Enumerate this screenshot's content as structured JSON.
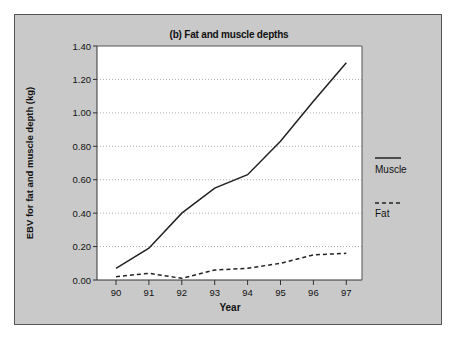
{
  "chart_data": {
    "type": "line",
    "title": "(b) Fat and muscle depths",
    "xlabel": "Year",
    "ylabel": "EBV for fat and muscle depth (kg)",
    "x": [
      "90",
      "91",
      "92",
      "93",
      "94",
      "95",
      "96",
      "97"
    ],
    "yticks": [
      "0.00",
      "0.20",
      "0.40",
      "0.60",
      "0.80",
      "1.00",
      "1.20",
      "1.40"
    ],
    "ylim": [
      0,
      1.4
    ],
    "grid": "horizontal dotted",
    "legend_position": "right",
    "series": [
      {
        "name": "Muscle",
        "style": "solid",
        "values": [
          0.07,
          0.19,
          0.4,
          0.55,
          0.63,
          0.83,
          1.07,
          1.3
        ]
      },
      {
        "name": "Fat",
        "style": "dashed",
        "values": [
          0.02,
          0.04,
          0.01,
          0.06,
          0.07,
          0.1,
          0.15,
          0.16
        ]
      }
    ]
  },
  "colors": {
    "panel_bg": "#c9c9c9",
    "plot_bg": "#ffffff",
    "line": "#222222",
    "grid": "#999999"
  }
}
